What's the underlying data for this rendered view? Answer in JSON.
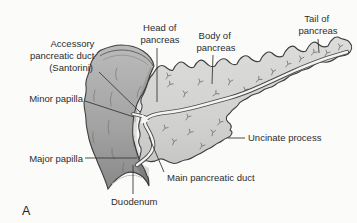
{
  "figure": {
    "panel_letter": "A",
    "labels": {
      "accessory_duct": {
        "line1": "Accessory",
        "line2": "pancreatic duct",
        "line3": "(Santorini)"
      },
      "minor_papilla": {
        "text": "Minor papilla"
      },
      "major_papilla": {
        "text": "Major papilla"
      },
      "head": {
        "line1": "Head of",
        "line2": "pancreas"
      },
      "body": {
        "line1": "Body of",
        "line2": "pancreas"
      },
      "tail": {
        "line1": "Tail of",
        "line2": "pancreas"
      },
      "uncinate": {
        "text": "Uncinate process"
      },
      "main_duct": {
        "text": "Main pancreatic duct"
      },
      "duodenum": {
        "text": "Duodenum"
      }
    },
    "colors": {
      "background": "#fbfbf9",
      "pancreas_fill": "#d3d3d1",
      "duodenum_fill_light": "#b9b9b9",
      "duodenum_fill_dark": "#868686",
      "duct_white": "#f4f4f2",
      "outline": "#3f3f3f",
      "text": "#2d2d2d"
    }
  }
}
